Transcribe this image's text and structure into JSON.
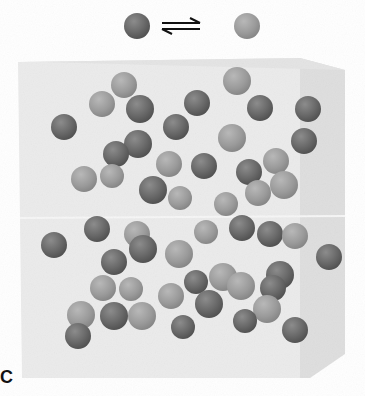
{
  "figure": {
    "label": "C",
    "equilibrium": {
      "reactant": "dark-sphere",
      "arrow": "equilibrium-harpoons",
      "product": "light-sphere"
    },
    "colors": {
      "dark_sphere": "#6a6a6a",
      "dark_sphere_highlight": "#8c8c8c",
      "dark_sphere_shadow": "#3e3e3e",
      "light_sphere": "#9a9a9a",
      "light_sphere_highlight": "#b8b8b8",
      "light_sphere_shadow": "#737373",
      "cube_front": "#eaeaea",
      "cube_side": "#dcdcdc",
      "background": "#ffffff"
    },
    "header": {
      "dark": {
        "x": 137,
        "y": 26,
        "r": 13
      },
      "light": {
        "x": 247,
        "y": 26,
        "r": 13
      }
    },
    "spheres": [
      {
        "x": 124,
        "y": 85,
        "r": 13,
        "type": "light"
      },
      {
        "x": 102,
        "y": 104,
        "r": 13,
        "type": "light"
      },
      {
        "x": 140,
        "y": 109,
        "r": 14,
        "type": "dark"
      },
      {
        "x": 64,
        "y": 127,
        "r": 13,
        "type": "dark"
      },
      {
        "x": 237,
        "y": 81,
        "r": 14,
        "type": "light"
      },
      {
        "x": 197,
        "y": 103,
        "r": 13,
        "type": "dark"
      },
      {
        "x": 260,
        "y": 108,
        "r": 13,
        "type": "dark"
      },
      {
        "x": 308,
        "y": 109,
        "r": 13,
        "type": "dark"
      },
      {
        "x": 176,
        "y": 127,
        "r": 13,
        "type": "dark"
      },
      {
        "x": 232,
        "y": 138,
        "r": 14,
        "type": "light"
      },
      {
        "x": 304,
        "y": 141,
        "r": 13,
        "type": "dark"
      },
      {
        "x": 138,
        "y": 144,
        "r": 14,
        "type": "dark"
      },
      {
        "x": 116,
        "y": 154,
        "r": 13,
        "type": "dark"
      },
      {
        "x": 169,
        "y": 164,
        "r": 13,
        "type": "light"
      },
      {
        "x": 204,
        "y": 166,
        "r": 13,
        "type": "dark"
      },
      {
        "x": 276,
        "y": 161,
        "r": 13,
        "type": "light"
      },
      {
        "x": 249,
        "y": 172,
        "r": 13,
        "type": "dark"
      },
      {
        "x": 84,
        "y": 179,
        "r": 13,
        "type": "light"
      },
      {
        "x": 112,
        "y": 176,
        "r": 12,
        "type": "light"
      },
      {
        "x": 284,
        "y": 185,
        "r": 14,
        "type": "light"
      },
      {
        "x": 153,
        "y": 190,
        "r": 14,
        "type": "dark"
      },
      {
        "x": 180,
        "y": 198,
        "r": 12,
        "type": "light"
      },
      {
        "x": 258,
        "y": 193,
        "r": 13,
        "type": "light"
      },
      {
        "x": 226,
        "y": 204,
        "r": 12,
        "type": "light"
      },
      {
        "x": 97,
        "y": 229,
        "r": 13,
        "type": "dark"
      },
      {
        "x": 137,
        "y": 234,
        "r": 13,
        "type": "light"
      },
      {
        "x": 206,
        "y": 232,
        "r": 12,
        "type": "light"
      },
      {
        "x": 242,
        "y": 228,
        "r": 13,
        "type": "dark"
      },
      {
        "x": 270,
        "y": 234,
        "r": 13,
        "type": "dark"
      },
      {
        "x": 295,
        "y": 236,
        "r": 13,
        "type": "light"
      },
      {
        "x": 54,
        "y": 245,
        "r": 13,
        "type": "dark"
      },
      {
        "x": 143,
        "y": 249,
        "r": 14,
        "type": "dark"
      },
      {
        "x": 179,
        "y": 254,
        "r": 14,
        "type": "light"
      },
      {
        "x": 329,
        "y": 257,
        "r": 13,
        "type": "dark"
      },
      {
        "x": 114,
        "y": 262,
        "r": 13,
        "type": "dark"
      },
      {
        "x": 223,
        "y": 277,
        "r": 14,
        "type": "light"
      },
      {
        "x": 280,
        "y": 275,
        "r": 14,
        "type": "dark"
      },
      {
        "x": 103,
        "y": 288,
        "r": 13,
        "type": "light"
      },
      {
        "x": 131,
        "y": 289,
        "r": 12,
        "type": "light"
      },
      {
        "x": 196,
        "y": 282,
        "r": 12,
        "type": "dark"
      },
      {
        "x": 171,
        "y": 296,
        "r": 13,
        "type": "light"
      },
      {
        "x": 241,
        "y": 286,
        "r": 14,
        "type": "light"
      },
      {
        "x": 209,
        "y": 304,
        "r": 14,
        "type": "dark"
      },
      {
        "x": 273,
        "y": 288,
        "r": 13,
        "type": "dark"
      },
      {
        "x": 81,
        "y": 315,
        "r": 14,
        "type": "light"
      },
      {
        "x": 114,
        "y": 316,
        "r": 14,
        "type": "dark"
      },
      {
        "x": 142,
        "y": 316,
        "r": 14,
        "type": "light"
      },
      {
        "x": 267,
        "y": 309,
        "r": 14,
        "type": "light"
      },
      {
        "x": 245,
        "y": 321,
        "r": 12,
        "type": "dark"
      },
      {
        "x": 183,
        "y": 327,
        "r": 12,
        "type": "dark"
      },
      {
        "x": 78,
        "y": 336,
        "r": 13,
        "type": "dark"
      },
      {
        "x": 295,
        "y": 330,
        "r": 13,
        "type": "dark"
      }
    ]
  }
}
